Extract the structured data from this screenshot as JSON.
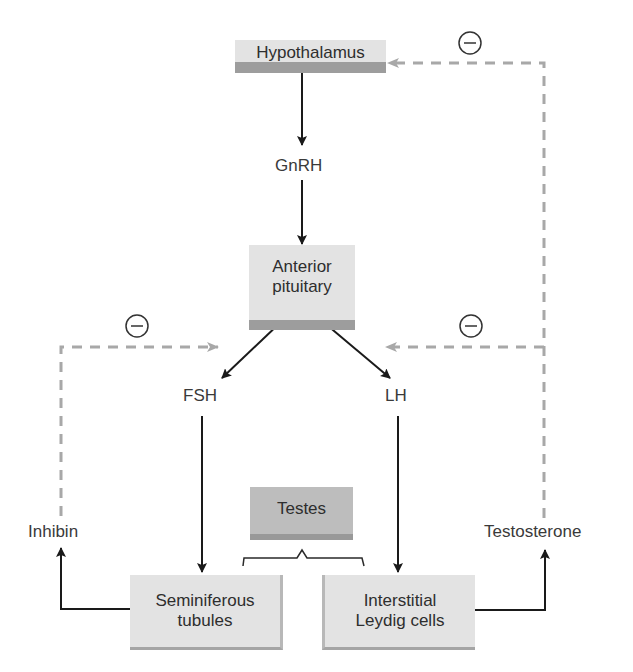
{
  "diagram": {
    "nodes": {
      "hypothalamus": "Hypothalamus",
      "gnrh": "GnRH",
      "anterior_pituitary_line1": "Anterior",
      "anterior_pituitary_line2": "pituitary",
      "fsh": "FSH",
      "lh": "LH",
      "testes": "Testes",
      "seminiferous_line1": "Seminiferous",
      "seminiferous_line2": "tubules",
      "interstitial_line1": "Interstitial",
      "interstitial_line2": "Leydig cells",
      "inhibin": "Inhibin",
      "testosterone": "Testosterone"
    },
    "feedback_symbol": "−",
    "colors": {
      "stimulatory_arrow": "#1a1a1a",
      "inhibitory_arrow": "#a8a8a8",
      "box_light": "#e3e3e3",
      "box_dark": "#bdbdbd",
      "box_band": "#9d9d9d"
    },
    "edges": [
      {
        "from": "Hypothalamus",
        "to": "GnRH",
        "type": "stimulatory"
      },
      {
        "from": "GnRH",
        "to": "Anterior pituitary",
        "type": "stimulatory"
      },
      {
        "from": "Anterior pituitary",
        "to": "FSH",
        "type": "stimulatory"
      },
      {
        "from": "Anterior pituitary",
        "to": "LH",
        "type": "stimulatory"
      },
      {
        "from": "FSH",
        "to": "Seminiferous tubules",
        "type": "stimulatory"
      },
      {
        "from": "LH",
        "to": "Interstitial Leydig cells",
        "type": "stimulatory"
      },
      {
        "from": "Seminiferous tubules",
        "to": "Inhibin",
        "type": "stimulatory"
      },
      {
        "from": "Interstitial Leydig cells",
        "to": "Testosterone",
        "type": "stimulatory"
      },
      {
        "from": "Inhibin",
        "to": "Anterior pituitary",
        "type": "inhibitory"
      },
      {
        "from": "Testosterone",
        "to": "Anterior pituitary",
        "type": "inhibitory"
      },
      {
        "from": "Testosterone",
        "to": "Hypothalamus",
        "type": "inhibitory"
      }
    ]
  }
}
